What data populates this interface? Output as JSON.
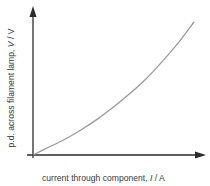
{
  "chart_data": {
    "type": "line",
    "title": "",
    "xlabel": "current through component, I / A",
    "ylabel": "p.d. across filament lamp, V / V",
    "xlabel_parts": {
      "prefix": "current through component, ",
      "symbol": "I",
      "suffix": " / A"
    },
    "ylabel_parts": {
      "prefix": "p.d. across filament lamp, ",
      "symbol": "V",
      "suffix": " / V"
    },
    "grid": false,
    "ticks": false,
    "legend": null,
    "series": [
      {
        "name": "filament lamp V–I characteristic",
        "shape": "concave-up (increasing gradient)",
        "x": [
          0,
          0.1,
          0.2,
          0.3,
          0.4,
          0.5,
          0.6,
          0.7,
          0.8,
          0.9,
          1.0
        ],
        "values": [
          0,
          0.06,
          0.12,
          0.19,
          0.27,
          0.36,
          0.46,
          0.57,
          0.7,
          0.84,
          1.0
        ]
      }
    ],
    "xlim": [
      0,
      1
    ],
    "ylim": [
      0,
      1.1
    ],
    "note": "qualitative sketch, no numeric scale shown"
  },
  "colors": {
    "axis": "#2b2b2b",
    "curve": "#9a9a9a",
    "text": "#3a3a3a"
  }
}
